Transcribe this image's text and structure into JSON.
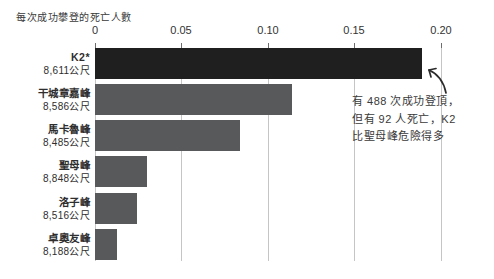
{
  "chart_data": {
    "type": "bar",
    "orientation": "horizontal",
    "title": "每次成功攀登的死亡人數",
    "xlabel": "",
    "ylabel": "",
    "xlim": [
      0,
      0.2
    ],
    "grid": true,
    "legend": "none",
    "x_ticks": [
      "0",
      "0.05",
      "0.10",
      "0.15",
      "0.20"
    ],
    "categories": [
      "K2*",
      "干城章嘉峰",
      "馬卡魯峰",
      "聖母峰",
      "洛子峰",
      "卓奧友峰"
    ],
    "elevations": [
      "8,611公尺",
      "8,586公尺",
      "8,485公尺",
      "8,848公尺",
      "8,516公尺",
      "8,188公尺"
    ],
    "values": [
      0.189,
      0.114,
      0.084,
      0.03,
      0.024,
      0.013
    ],
    "bar_colors": [
      "#1f1f1f",
      "#58595b",
      "#58595b",
      "#58595b",
      "#58595b",
      "#58595b"
    ],
    "annotation": {
      "lines": [
        "有 488 次成功登頂，",
        "但有 92 人死亡，K2",
        "比聖母峰危險得多"
      ]
    }
  },
  "colors": {
    "k2_bar": "#1f1f1f",
    "other_bars": "#58595b",
    "gridline": "#c5c5c5",
    "text": "#333333"
  }
}
